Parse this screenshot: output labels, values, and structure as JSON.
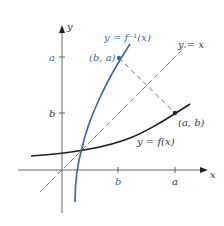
{
  "diagram": {
    "axes": {
      "x_label": "x",
      "y_label": "y",
      "x_ticks": [
        {
          "label": "b",
          "color": "#3b6aa8"
        },
        {
          "label": "a",
          "color": "#3a3a3a"
        }
      ],
      "y_ticks": [
        {
          "label": "a",
          "color": "#3b6aa8"
        },
        {
          "label": "b",
          "color": "#3a3a3a"
        }
      ]
    },
    "curves": {
      "inverse": {
        "label": "y = f⁻¹(x)",
        "color": "#3b6aa8"
      },
      "function": {
        "label": "y = f(x)",
        "color": "#222222"
      },
      "identity": {
        "label": "y = x",
        "color": "#555555",
        "style": "dashed"
      }
    },
    "points": {
      "ba": {
        "label": "(b, a)",
        "color": "#3b6aa8"
      },
      "ab": {
        "label": "(a, b)",
        "color": "#3a3a3a"
      }
    },
    "colors": {
      "blue": "#3b6aa8",
      "black": "#222222",
      "axis": "#555555"
    }
  }
}
